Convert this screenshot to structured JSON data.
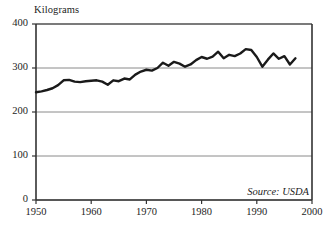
{
  "chart_data": {
    "type": "line",
    "title": "",
    "subtitle": "",
    "ylabel": "Kilograms",
    "xlabel": "",
    "ylim": [
      0,
      400
    ],
    "xlim": [
      1950,
      2000
    ],
    "yticks": [
      0,
      100,
      200,
      300,
      400
    ],
    "xticks": [
      1950,
      1960,
      1970,
      1980,
      1990,
      2000
    ],
    "ytick_labels": [
      "0",
      "100",
      "200",
      "300",
      "400"
    ],
    "xtick_labels": [
      "1950",
      "1960",
      "1970",
      "1980",
      "1990",
      "2000"
    ],
    "grid": "horizontal",
    "legend": "none",
    "annotations": [
      {
        "text": "Source: USDA",
        "position": "bottom-right",
        "style": "italic"
      }
    ],
    "series": [
      {
        "name": "Meat consumption per capita",
        "color": "#1a1a1a",
        "line_width": 2.4,
        "x": [
          1950,
          1951,
          1952,
          1953,
          1954,
          1955,
          1956,
          1957,
          1958,
          1959,
          1960,
          1961,
          1962,
          1963,
          1964,
          1965,
          1966,
          1967,
          1968,
          1969,
          1970,
          1971,
          1972,
          1973,
          1974,
          1975,
          1976,
          1977,
          1978,
          1979,
          1980,
          1981,
          1982,
          1983,
          1984,
          1985,
          1986,
          1987,
          1988,
          1989,
          1990,
          1991,
          1992,
          1993,
          1994,
          1995,
          1996,
          1997
        ],
        "values": [
          245,
          247,
          250,
          254,
          261,
          272,
          273,
          269,
          268,
          270,
          271,
          272,
          269,
          262,
          272,
          270,
          276,
          274,
          285,
          292,
          296,
          294,
          300,
          312,
          305,
          314,
          310,
          303,
          308,
          318,
          325,
          321,
          326,
          337,
          322,
          330,
          327,
          333,
          343,
          341,
          325,
          303,
          319,
          333,
          321,
          327,
          308,
          322
        ]
      }
    ]
  },
  "axis_titles": {
    "y": "Kilograms"
  },
  "colors": {
    "line": "#1a1a1a",
    "grid": "#888888",
    "axis": "#333333",
    "background": "#ffffff"
  }
}
